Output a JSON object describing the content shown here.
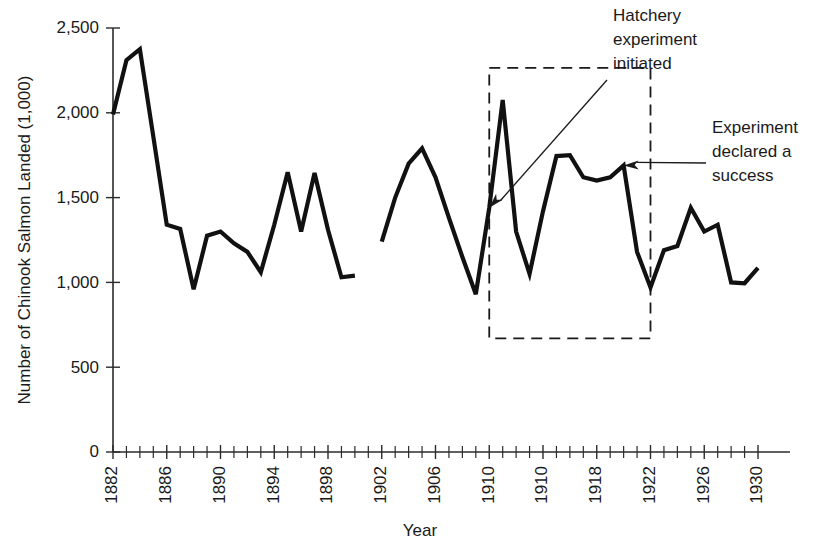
{
  "chart_data": {
    "type": "line",
    "title": "",
    "xlabel": "Year",
    "ylabel": "Number of Chinook Salmon Landed (1,000)",
    "xlim": [
      1882,
      1930
    ],
    "ylim": [
      0,
      2500
    ],
    "grid": false,
    "legend": "none",
    "y_ticks": [
      0,
      500,
      1000,
      1500,
      2000,
      2500
    ],
    "y_tick_labels": [
      "0",
      "500",
      "1,000",
      "1,500",
      "2,000",
      "2,500"
    ],
    "x_ticks": [
      1882,
      1886,
      1890,
      1894,
      1898,
      1902,
      1906,
      1910,
      1914,
      1918,
      1922,
      1926,
      1930
    ],
    "x_tick_labels": [
      "1882",
      "1886",
      "1890",
      "1894",
      "1898",
      "1902",
      "1906",
      "1910",
      "1910",
      "1918",
      "1922",
      "1926",
      "1930"
    ],
    "x_minor_tick_interval": 1,
    "series": [
      {
        "name": "Chinook salmon landed",
        "note": "series is drawn in two segments with a data gap at 1900-1901",
        "segments": [
          {
            "x": [
              1882,
              1883,
              1884,
              1885,
              1886,
              1887,
              1888,
              1889,
              1890,
              1891,
              1892,
              1893,
              1894,
              1895,
              1896,
              1897,
              1898,
              1899,
              1900
            ],
            "y": [
              1990,
              2310,
              2375,
              1860,
              1340,
              1315,
              960,
              1275,
              1300,
              1230,
              1180,
              1060,
              1340,
              1650,
              1300,
              1645,
              1310,
              1030,
              1040
            ]
          },
          {
            "x": [
              1902,
              1903,
              1904,
              1905,
              1906,
              1907,
              1908,
              1909,
              1910,
              1911,
              1912,
              1913,
              1914,
              1915,
              1916,
              1917,
              1918,
              1919,
              1920,
              1921,
              1922,
              1923,
              1924,
              1925,
              1926,
              1927,
              1928,
              1929,
              1930
            ],
            "y": [
              1240,
              1500,
              1700,
              1790,
              1620,
              1380,
              1150,
              930,
              1440,
              2075,
              1300,
              1050,
              1420,
              1745,
              1750,
              1620,
              1600,
              1620,
              1690,
              1180,
              970,
              1190,
              1215,
              1440,
              1300,
              1340,
              1000,
              995,
              1085
            ]
          }
        ]
      }
    ],
    "annotations": [
      {
        "id": "hatchery-initiated",
        "text_lines": [
          "Hatchery",
          "experiment",
          "initiated"
        ],
        "points_to_x": 1910,
        "points_to_y": 1440
      },
      {
        "id": "experiment-success",
        "text_lines": [
          "Experiment",
          "declared a",
          "success"
        ],
        "points_to_x": 1920,
        "points_to_y": 1690
      }
    ],
    "highlight_box": {
      "x_start": 1910,
      "x_end": 1922,
      "y_start": 670,
      "y_end": 2265,
      "style": "dashed"
    },
    "colors": {
      "line": "#111111",
      "axis": "#2b2b2b",
      "text": "#1a1a1a",
      "background": "#ffffff"
    }
  }
}
